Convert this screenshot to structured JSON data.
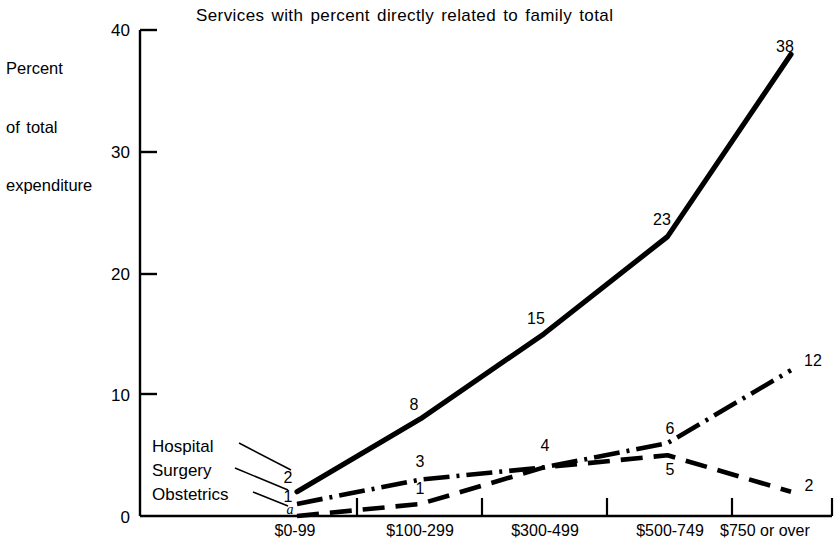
{
  "chart_data": {
    "type": "line",
    "title": "Services with percent directly related to family total",
    "xlabel": "",
    "ylabel": "Percent of total expenditure",
    "ylabel_lines": [
      "Percent",
      "of total",
      "expenditure"
    ],
    "categories": [
      "$0-99",
      "$100-299",
      "$300-499",
      "$500-749",
      "$750 or over"
    ],
    "ylim": [
      0,
      40
    ],
    "yticks": [
      0,
      10,
      20,
      30,
      40
    ],
    "ytick_labels": [
      "0",
      "10",
      "20",
      "30",
      "40"
    ],
    "grid": false,
    "legend_position": "inline-left-leader-lines",
    "series": [
      {
        "name": "Hospital",
        "style": "solid",
        "values": [
          2,
          8,
          15,
          23,
          38
        ],
        "value_labels": [
          "2",
          "8",
          "15",
          "23",
          "38"
        ]
      },
      {
        "name": "Surgery",
        "style": "dash-dot",
        "values": [
          1,
          3,
          4,
          6,
          12
        ],
        "value_labels": [
          "1",
          "3",
          "4",
          "6",
          "12"
        ]
      },
      {
        "name": "Obstetrics",
        "style": "dashed",
        "values": [
          0,
          1,
          4,
          5,
          2
        ],
        "value_labels": [
          "a",
          "1",
          "4",
          "5",
          "2"
        ]
      }
    ],
    "annotations": [
      {
        "text": "a",
        "meaning": "footnote marker at Obstetrics $0-99 point"
      }
    ],
    "colors": {
      "line": "#000000",
      "axis": "#000000",
      "background": "#ffffff"
    }
  }
}
